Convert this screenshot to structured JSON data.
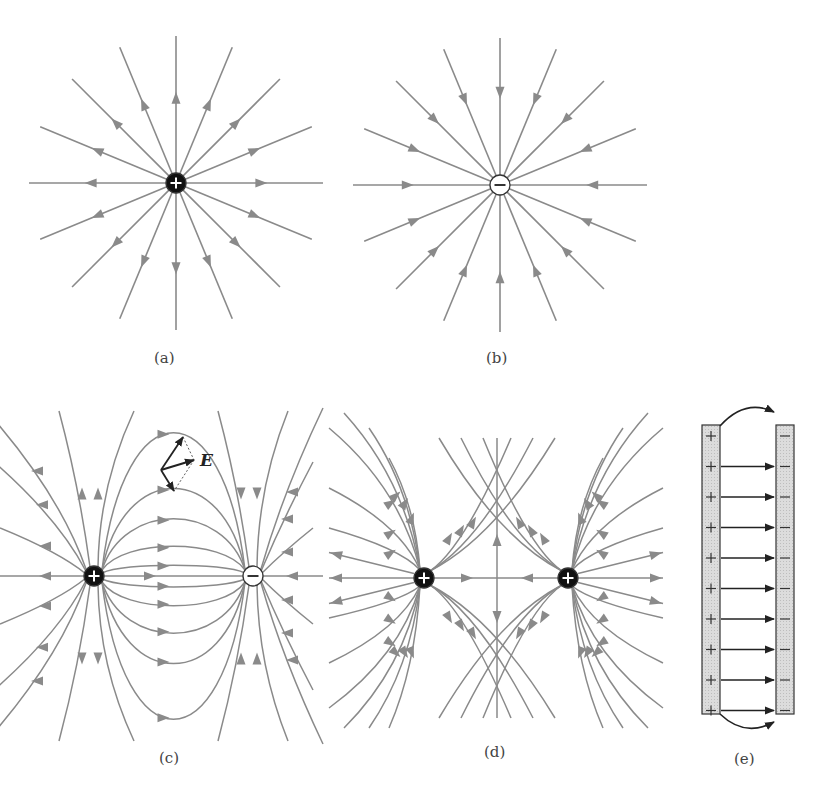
{
  "figure": {
    "panels": [
      {
        "id": "a",
        "label": "(a)",
        "description": "Single positive point charge, radial field lines pointing outward",
        "charges": [
          {
            "sign": "+",
            "x": 176,
            "y": 183
          }
        ],
        "line_count": 16
      },
      {
        "id": "b",
        "label": "(b)",
        "description": "Single negative point charge, radial field lines pointing inward",
        "charges": [
          {
            "sign": "−",
            "x": 500,
            "y": 185
          }
        ],
        "line_count": 16
      },
      {
        "id": "c",
        "label": "(c)",
        "description": "Electric dipole: positive and negative charge with field lines from + to −",
        "charges": [
          {
            "sign": "+",
            "x": 94,
            "y": 576
          },
          {
            "sign": "−",
            "x": 253,
            "y": 576
          }
        ],
        "vector_label": "E"
      },
      {
        "id": "d",
        "label": "(d)",
        "description": "Two equal positive charges with repelling field lines",
        "charges": [
          {
            "sign": "+",
            "x": 424,
            "y": 578
          },
          {
            "sign": "+",
            "x": 568,
            "y": 578
          }
        ]
      },
      {
        "id": "e",
        "label": "(e)",
        "description": "Parallel plate capacitor with uniform field from + plate to − plate",
        "plus_plate_signs": 10,
        "minus_plate_signs": 10,
        "field_arrows": 9
      }
    ],
    "colors": {
      "field_line": "#8a8a8a",
      "charge_fill": "#111111",
      "plate_fill": "#d8d8d8",
      "arrow_dark": "#222222"
    }
  }
}
